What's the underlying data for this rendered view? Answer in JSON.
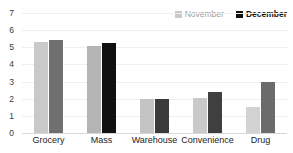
{
  "chart_data": {
    "type": "bar",
    "title": "",
    "xlabel": "",
    "ylabel": "",
    "categories": [
      "Grocery",
      "Mass",
      "Warehouse",
      "Convenience",
      "Drug"
    ],
    "series": [
      {
        "name": "November",
        "color": "#c9c9c9",
        "values": [
          5.3,
          5.1,
          2.0,
          2.05,
          1.5
        ]
      },
      {
        "name": "December",
        "color": "#6b6b6b",
        "values": [
          5.45,
          5.25,
          2.0,
          2.4,
          2.95
        ]
      }
    ],
    "bar_colors": {
      "november": [
        "#c9c9c9",
        "#b4b4b4",
        "#c4c4c4",
        "#c9c9c9",
        "#d2d2d2"
      ],
      "december": [
        "#6f6f6f",
        "#111111",
        "#3b3b3b",
        "#3f3f3f",
        "#6b6b6b"
      ]
    },
    "ylim": [
      0,
      7
    ],
    "yticks": [
      7,
      6,
      5,
      4,
      3,
      2,
      1,
      0
    ],
    "ytick_labels": [
      "7",
      "6",
      "5",
      "4",
      "3",
      "2",
      "1",
      "0"
    ],
    "grid": true,
    "legend_position": "top-right",
    "legend": [
      {
        "label": "November",
        "swatch": "#c9c9c9"
      },
      {
        "label": "December",
        "swatch": "#111111"
      }
    ]
  }
}
